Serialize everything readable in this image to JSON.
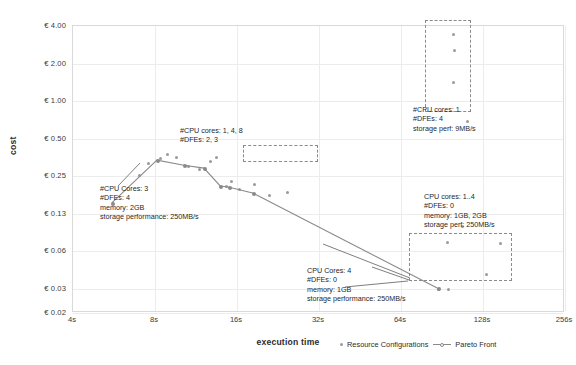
{
  "chart_data": {
    "type": "scatter",
    "title": "",
    "xlabel": "execution time",
    "ylabel": "cost",
    "xscale": "log2",
    "yscale": "log2",
    "xlim": [
      4,
      256
    ],
    "ylim": [
      0.02,
      4.0
    ],
    "grid": true,
    "xticks": [
      "4s",
      "8s",
      "16s",
      "32s",
      "64s",
      "128s",
      "256s"
    ],
    "xtick_values": [
      4,
      8,
      16,
      32,
      64,
      128,
      256
    ],
    "yticks": [
      "€ 4.00",
      "€ 2.00",
      "€ 1.00",
      "€ 0.50",
      "€ 0.25",
      "€ 0.13",
      "€ 0.06",
      "€ 0.03",
      "€ 0.02"
    ],
    "ytick_values": [
      4.0,
      2.0,
      1.0,
      0.5,
      0.25,
      0.13,
      0.06,
      0.03,
      0.02
    ],
    "legend_position": "bottom-right",
    "series": [
      {
        "name": "Resource Configurations",
        "type": "scatter",
        "color": "#9a9a9a",
        "points": [
          [
            7.0,
            0.255
          ],
          [
            7.6,
            0.315
          ],
          [
            8.4,
            0.345
          ],
          [
            8.9,
            0.375
          ],
          [
            9.6,
            0.355
          ],
          [
            10.6,
            0.3
          ],
          [
            11.7,
            0.285
          ],
          [
            12.8,
            0.325
          ],
          [
            13.5,
            0.35
          ],
          [
            14.6,
            0.205
          ],
          [
            15.3,
            0.225
          ],
          [
            16.3,
            0.195
          ],
          [
            18.6,
            0.215
          ],
          [
            21.0,
            0.175
          ],
          [
            24.5,
            0.185
          ],
          [
            100.0,
            3.4
          ],
          [
            101.0,
            2.55
          ],
          [
            100.0,
            1.42
          ],
          [
            112.0,
            0.69
          ],
          [
            95.0,
            0.073
          ],
          [
            108.0,
            0.098
          ],
          [
            132.0,
            0.041
          ],
          [
            96.0,
            0.031
          ],
          [
            148.0,
            0.072
          ],
          [
            88.0,
            0.031
          ]
        ]
      },
      {
        "name": "Pareto Front",
        "type": "line",
        "color": "#8a8a8a",
        "points": [
          [
            5.6,
            0.15
          ],
          [
            8.2,
            0.33
          ],
          [
            10.3,
            0.3
          ],
          [
            12.2,
            0.285
          ],
          [
            14.0,
            0.205
          ],
          [
            15.1,
            0.2
          ],
          [
            18.4,
            0.18
          ],
          [
            88.0,
            0.031
          ]
        ]
      }
    ],
    "annotations": [
      {
        "id": "anno-left",
        "lines": [
          "#CPU Cores: 3",
          "#DFEs: 4",
          "memory: 2GB",
          "storage performance: 250MB/s"
        ],
        "bold_parts": [
          "3",
          "4"
        ]
      },
      {
        "id": "anno-top-cluster",
        "lines": [
          "#CPU cores: 1, 4, 8",
          "#DFEs: 2, 3"
        ],
        "bold_parts": []
      },
      {
        "id": "anno-top-right",
        "lines": [
          "#CPU cores: 1",
          "#DFEs: 4",
          "storage perf: 9MB/s"
        ],
        "bold_parts": [
          "9MB/s"
        ]
      },
      {
        "id": "anno-right",
        "lines": [
          "CPU cores: 1..4",
          "#DFEs: 0",
          "memory: 1GB, 2GB",
          "storage perf: 250MB/s"
        ],
        "bold_parts": []
      },
      {
        "id": "anno-bottom",
        "lines": [
          "CPU Cores: 4",
          "#DFEs: 0",
          "memory: 1GB",
          "storage performance: 250MB/s"
        ],
        "bold_parts": []
      }
    ]
  },
  "axis": {
    "x_title": "execution time",
    "y_title": "cost",
    "xticks": [
      "4s",
      "8s",
      "16s",
      "32s",
      "64s",
      "128s",
      "256s"
    ],
    "yticks": [
      "€ 4.00",
      "€ 2.00",
      "€ 1.00",
      "€ 0.50",
      "€ 0.25",
      "€ 0.13",
      "€ 0.06",
      "€ 0.03",
      "€ 0.02"
    ]
  },
  "legend": {
    "scatter_label": "Resource Configurations",
    "line_label": "Pareto Front"
  },
  "annotations": {
    "left": {
      "l1": "#CPU Cores: 3",
      "l2": "#DFEs: 4",
      "l3": "memory: 2GB",
      "l4": "storage performance: 250MB/s"
    },
    "top_cluster": {
      "l1": "#CPU cores: 1, 4, 8",
      "l2": "#DFEs: 2, 3"
    },
    "top_right": {
      "l1": "#CPU cores: 1",
      "l2": "#DFEs: 4",
      "l3": "storage perf: 9MB/s"
    },
    "right": {
      "l1": "CPU cores: 1..4",
      "l2": "#DFEs: 0",
      "l3": "memory: 1GB, 2GB",
      "l4": "storage perf: 250MB/s"
    },
    "bottom": {
      "l1": "CPU Cores: 4",
      "l2": "#DFEs: 0",
      "l3": "memory: 1GB",
      "l4": "storage performance: 250MB/s"
    }
  },
  "colors": {
    "scatter": "#9a9a9a",
    "pareto": "#8a8a8a",
    "grid": "#ececec",
    "frame": "#d9d9d9",
    "box": "#8a8a8a"
  }
}
